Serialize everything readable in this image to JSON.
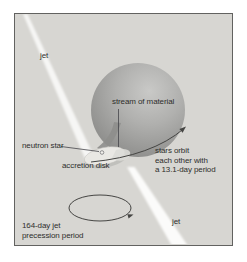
{
  "diagram": {
    "title_context": "neutron star binary with precessing jets",
    "labels": {
      "jet_top": "jet",
      "stream_of_material": "stream of material",
      "neutron_star": "neutron star",
      "accretion_disk": "accretion disk",
      "jet_bottom": "jet"
    },
    "orbit_note_lines": [
      "stars orbit",
      "each other with",
      "a 13.1-day period"
    ],
    "precession_note_lines": [
      "164-day jet",
      "precession period"
    ],
    "values": {
      "orbit_period_days": "13.1",
      "precession_period_days": "164"
    },
    "colors": {
      "page_background": "#ffffff",
      "panel_background": "#d7d6d2",
      "frame_border": "#626260",
      "star_light": "#c9c9c7",
      "star_dark": "#8c8c8a",
      "disk_fill": "#e9e8e4",
      "jet_beam": "#fdfdfc",
      "line_color": "#454543",
      "text_color": "#2e2e2c"
    }
  }
}
